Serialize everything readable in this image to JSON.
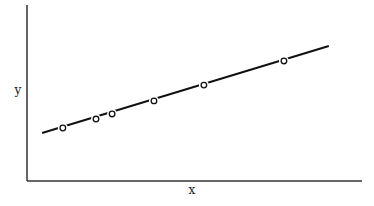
{
  "chart_data": {
    "type": "line",
    "title": "",
    "xlabel": "x",
    "ylabel": "y",
    "xlim": [
      0,
      10
    ],
    "ylim": [
      0,
      10
    ],
    "grid": false,
    "legend": null,
    "ticks": false,
    "series": [
      {
        "name": "fit-line",
        "style": "solid",
        "x": [
          0.45,
          9.01
        ],
        "y": [
          2.73,
          7.67
        ]
      },
      {
        "name": "data-points",
        "marker": "open-circle",
        "x": [
          1.07,
          2.06,
          2.54,
          3.79,
          5.28,
          7.67
        ],
        "y": [
          3.01,
          3.52,
          3.81,
          4.55,
          5.45,
          6.82
        ]
      }
    ]
  },
  "colors": {
    "axis": "#333333",
    "line": "#111111",
    "marker_stroke": "#111111",
    "marker_fill": "#ffffff",
    "background": "#ffffff"
  },
  "layout": {
    "plot": {
      "left": 27,
      "top": 5,
      "right": 362,
      "bottom": 181
    }
  }
}
